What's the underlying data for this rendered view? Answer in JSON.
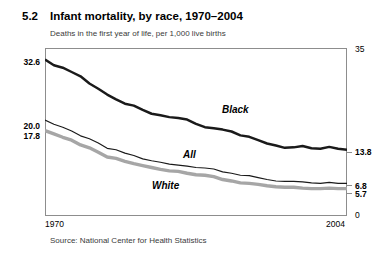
{
  "figure": {
    "number": "5.2",
    "title": "Infant mortality, by race, 1970–2004",
    "subtitle": "Deaths in the first year of life, per 1,000 live births",
    "source": "Source: National Center for Health Statistics"
  },
  "axis": {
    "left_labels": [
      "32.6",
      "20.0",
      "17.8"
    ],
    "right_labels": [
      "35",
      "13.8",
      "6.8",
      "5.7",
      "0"
    ],
    "x_start": "1970",
    "x_end": "2004"
  },
  "series_labels": {
    "black": "Black",
    "all": "All",
    "white": "White"
  },
  "colors": {
    "black_line": "#1a1a1a",
    "all_line": "#1a1a1a",
    "white_line": "#a6a6a6",
    "frame": "#8d8d8d",
    "text": "#000000",
    "subtitle_text": "#3b3b3b"
  },
  "chart_data": {
    "type": "line",
    "title": "Infant mortality, by race, 1970–2004",
    "subtitle": "Deaths in the first year of life, per 1,000 live births",
    "xlabel": "",
    "ylabel": "Deaths in the first year of life, per 1,000 live births",
    "xlim": [
      1970,
      2004
    ],
    "ylim": [
      0,
      35
    ],
    "grid": false,
    "legend": "inline-labels",
    "x": [
      1970,
      1971,
      1972,
      1973,
      1974,
      1975,
      1976,
      1977,
      1978,
      1979,
      1980,
      1981,
      1982,
      1983,
      1984,
      1985,
      1986,
      1987,
      1988,
      1989,
      1990,
      1991,
      1992,
      1993,
      1994,
      1995,
      1996,
      1997,
      1998,
      1999,
      2000,
      2001,
      2002,
      2003,
      2004
    ],
    "series": [
      {
        "name": "Black",
        "color": "#1a1a1a",
        "values": [
          32.6,
          31.4,
          30.9,
          30.0,
          29.1,
          27.6,
          26.5,
          25.3,
          24.3,
          23.4,
          23.0,
          22.1,
          21.3,
          21.0,
          20.6,
          20.4,
          20.1,
          19.2,
          18.5,
          18.3,
          18.0,
          17.6,
          16.8,
          16.5,
          15.8,
          15.1,
          14.7,
          14.2,
          14.3,
          14.6,
          14.1,
          14.0,
          14.4,
          14.0,
          13.8
        ]
      },
      {
        "name": "All",
        "color": "#1a1a1a",
        "values": [
          20.0,
          19.1,
          18.5,
          17.7,
          16.7,
          16.1,
          15.2,
          14.1,
          13.8,
          13.1,
          12.6,
          11.9,
          11.5,
          11.2,
          10.8,
          10.6,
          10.4,
          10.1,
          10.0,
          9.8,
          9.2,
          8.9,
          8.5,
          8.4,
          8.0,
          7.6,
          7.3,
          7.2,
          7.2,
          7.1,
          6.9,
          6.8,
          7.0,
          6.8,
          6.8
        ]
      },
      {
        "name": "White",
        "color": "#a6a6a6",
        "values": [
          17.8,
          17.1,
          16.4,
          15.8,
          14.8,
          14.2,
          13.3,
          12.3,
          12.0,
          11.4,
          10.9,
          10.5,
          10.1,
          9.7,
          9.4,
          9.3,
          8.9,
          8.6,
          8.5,
          8.2,
          7.6,
          7.3,
          6.9,
          6.8,
          6.6,
          6.3,
          6.1,
          6.0,
          6.0,
          5.8,
          5.7,
          5.7,
          5.8,
          5.7,
          5.7
        ]
      }
    ],
    "annotations": [
      {
        "text": "32.6",
        "position": "left-axis-start",
        "series": "Black"
      },
      {
        "text": "20.0",
        "position": "left-axis-start",
        "series": "All"
      },
      {
        "text": "17.8",
        "position": "left-axis-start",
        "series": "White"
      },
      {
        "text": "13.8",
        "position": "right-axis-end",
        "series": "Black"
      },
      {
        "text": "6.8",
        "position": "right-axis-end",
        "series": "All"
      },
      {
        "text": "5.7",
        "position": "right-axis-end",
        "series": "White"
      }
    ]
  }
}
